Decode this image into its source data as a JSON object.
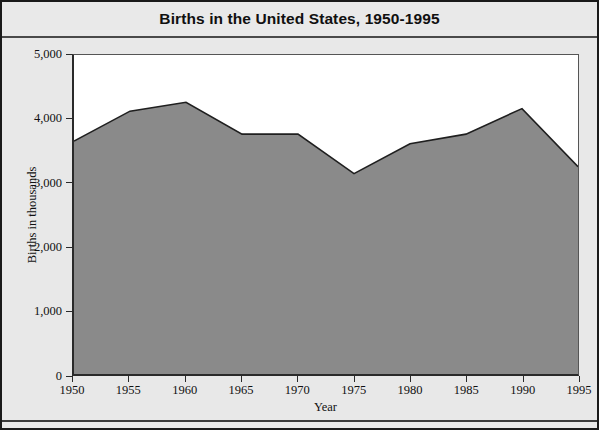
{
  "chart_data": {
    "type": "area",
    "title": "Births in the United States, 1950-1995",
    "xlabel": "Year",
    "ylabel": "Births in thousands",
    "x": [
      1950,
      1955,
      1960,
      1965,
      1970,
      1975,
      1980,
      1985,
      1990,
      1995
    ],
    "values": [
      3650,
      4120,
      4260,
      3760,
      3760,
      3140,
      3610,
      3760,
      4160,
      3250
    ],
    "categories": [
      "1950",
      "1955",
      "1960",
      "1965",
      "1970",
      "1975",
      "1980",
      "1985",
      "1990",
      "1995"
    ],
    "xlim": [
      1950,
      1995
    ],
    "ylim": [
      0,
      5000
    ],
    "ytick_labels": [
      "5,000",
      "4,000",
      "3,000",
      "2,000",
      "1,000",
      "0"
    ],
    "ytick_values": [
      5000,
      4000,
      3000,
      2000,
      1000,
      0
    ],
    "xtick_labels": [
      "1950",
      "1955",
      "1960",
      "1965",
      "1970",
      "1975",
      "1980",
      "1985",
      "1990",
      "1995"
    ],
    "grid": false,
    "legend": null,
    "fill_color": "#8a8a8a",
    "line_color": "#1f1f1f",
    "plot_background": "#ffffff",
    "figure_background": "#e8e8e8"
  }
}
